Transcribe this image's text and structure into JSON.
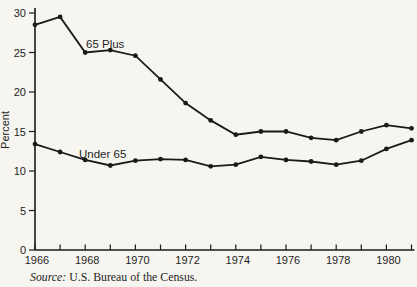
{
  "figure": {
    "y_axis_title": "Percent",
    "source_label": "Source:",
    "source_text": " U.S. Bureau of the Census.",
    "background_color": "#f6f5f0",
    "ink_color": "#1a1a1a"
  },
  "chart_data": {
    "type": "line",
    "title": "",
    "xlabel": "",
    "ylabel": "Percent",
    "x": [
      1966,
      1967,
      1968,
      1969,
      1970,
      1971,
      1972,
      1973,
      1974,
      1975,
      1976,
      1977,
      1978,
      1979,
      1980,
      1981
    ],
    "series": [
      {
        "name": "65 Plus",
        "values": [
          28.5,
          29.5,
          25.0,
          25.3,
          24.6,
          21.6,
          18.6,
          16.4,
          14.6,
          15.0,
          15.0,
          14.2,
          13.9,
          15.0,
          15.8,
          15.4
        ]
      },
      {
        "name": "Under 65",
        "values": [
          13.4,
          12.4,
          11.4,
          10.7,
          11.3,
          11.5,
          11.4,
          10.6,
          10.8,
          11.8,
          11.4,
          11.2,
          10.8,
          11.3,
          12.8,
          13.9
        ]
      }
    ],
    "ylim": [
      0,
      30
    ],
    "y_ticks": [
      0,
      5,
      10,
      15,
      20,
      25,
      30
    ],
    "x_tick_years": [
      1966,
      1967,
      1968,
      1969,
      1970,
      1971,
      1972,
      1973,
      1974,
      1975,
      1976,
      1977,
      1978,
      1979,
      1980,
      1981
    ],
    "x_label_years": [
      1966,
      1968,
      1970,
      1972,
      1974,
      1976,
      1978,
      1980
    ],
    "grid": "off",
    "legend": "inline-labels",
    "marker": "filled-dot",
    "line_color": "#1a1a1a",
    "source": "Source: U.S. Bureau of the Census."
  }
}
